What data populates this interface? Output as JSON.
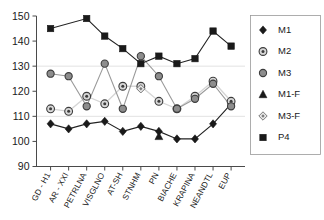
{
  "chart_data": {
    "type": "line",
    "title": "",
    "xlabel": "",
    "ylabel": "",
    "ylim": [
      90,
      150
    ],
    "yticks": [
      90,
      100,
      110,
      120,
      130,
      140,
      150
    ],
    "gridlines": [
      110,
      130
    ],
    "grid": true,
    "legend_position": "right",
    "categories": [
      "GD - H1",
      "AR - XXI",
      "PETRLNA",
      "VISGLNO",
      "AT-SH",
      "STNHM",
      "PN",
      "BIACHE",
      "KRAPINA",
      "NEANDTL",
      "EUP"
    ],
    "series": [
      {
        "name": "M1",
        "marker": "diamond",
        "color": "#1a1a1a",
        "values": [
          107,
          105,
          107,
          108,
          104,
          106,
          104,
          101,
          101,
          107,
          115
        ]
      },
      {
        "name": "M2",
        "marker": "circle-dot",
        "color": "#555555",
        "values": [
          113,
          112,
          118,
          115,
          122,
          122,
          116,
          113,
          118,
          124,
          116
        ]
      },
      {
        "name": "M3",
        "marker": "circle-filled",
        "color": "#6e6e6e",
        "values": [
          127,
          126,
          114,
          131,
          113,
          134,
          126,
          113,
          117,
          123,
          114
        ]
      },
      {
        "name": "M1-F",
        "marker": "triangle",
        "color": "#1a1a1a",
        "values": [
          null,
          null,
          null,
          null,
          null,
          null,
          102,
          null,
          null,
          null,
          null
        ]
      },
      {
        "name": "M3-F",
        "marker": "small-diamond",
        "color": "#8a8a8a",
        "values": [
          null,
          null,
          null,
          null,
          null,
          121,
          null,
          null,
          null,
          null,
          null
        ]
      },
      {
        "name": "P4",
        "marker": "square",
        "color": "#1a1a1a",
        "values": [
          145,
          null,
          149,
          142,
          137,
          131,
          134,
          131,
          133,
          144,
          138
        ]
      }
    ]
  },
  "legend": {
    "entries": [
      {
        "label": "M1",
        "marker": "diamond"
      },
      {
        "label": "M2",
        "marker": "circle-dot"
      },
      {
        "label": "M3",
        "marker": "circle-filled"
      },
      {
        "label": "M1-F",
        "marker": "triangle"
      },
      {
        "label": "M3-F",
        "marker": "small-diamond"
      },
      {
        "label": "P4",
        "marker": "square"
      }
    ]
  },
  "axis": {
    "y_labels": [
      "150",
      "140",
      "130",
      "120",
      "110",
      "100",
      "90"
    ]
  }
}
